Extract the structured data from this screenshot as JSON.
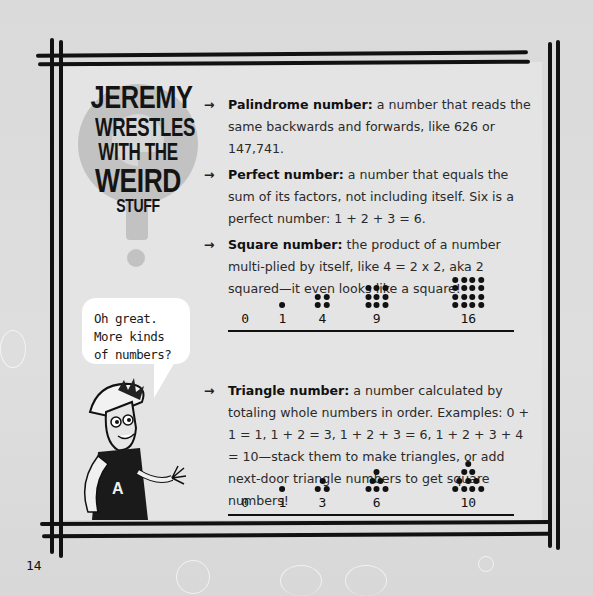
{
  "sidebar": {
    "title_lines": [
      "JEREMY",
      "WRESTLES",
      "WITH THE",
      "WEIRD",
      "STUFF"
    ],
    "speech_bubble": [
      "Oh great.",
      "More kinds",
      "of numbers?"
    ],
    "character_shirt_letter": "A"
  },
  "definitions": [
    {
      "arrow": "→",
      "term": "Palindrome number:",
      "text": " a number that reads the same backwards and forwards, like 626 or 147,741."
    },
    {
      "arrow": "→",
      "term": "Perfect number:",
      "text": " a number that equals the sum of its factors, not including itself. Six is a perfect number: 1 + 2 + 3 = 6."
    },
    {
      "arrow": "→",
      "term": "Square number:",
      "text": " the product of a number multi-plied by itself, like 4 = 2 x 2, aka 2 squared—it even looks like a square!"
    },
    {
      "arrow": "→",
      "term": "Triangle number:",
      "text": " a number calculated by totaling whole numbers in order. Examples: 0 + 1 = 1, 1 + 2 = 3, 1 + 2 + 3 = 6, 1 + 2 + 3 + 4 = 10—stack them to make triangles, or add next-door triangle numbers to get square numbers!"
    }
  ],
  "square_figure": {
    "labels": [
      "0",
      "1",
      "4",
      "9",
      "16"
    ],
    "values": [
      0,
      1,
      4,
      9,
      16
    ],
    "shape": "square"
  },
  "triangle_figure": {
    "labels": [
      "0",
      "1",
      "3",
      "6",
      "10"
    ],
    "values": [
      0,
      1,
      3,
      6,
      10
    ],
    "shape": "triangle"
  },
  "page_number": "14",
  "colors": {
    "page_background": "#dcdcdc",
    "panel_background": "#e4e4e4",
    "frame": "#111111",
    "title_circle": "#bdbdbd"
  }
}
